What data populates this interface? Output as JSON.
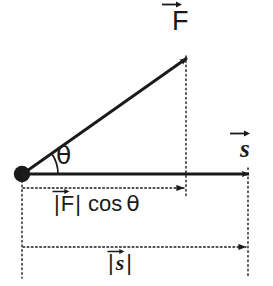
{
  "diagram": {
    "background_color": "#ffffff",
    "stroke_color": "#1a1a1a",
    "labels": {
      "force_vector": "F",
      "force_vector_accent": "vector-arrow",
      "displacement_vector": "s",
      "displacement_vector_accent": "vector-arrow",
      "angle": "θ",
      "force_component_bar_open": "|",
      "force_component_symbol": "F",
      "force_component_bar_close": "|",
      "force_component_cos": "cos",
      "force_component_angle": "θ",
      "displacement_magnitude_bar_open": "|",
      "displacement_magnitude_symbol": "s",
      "displacement_magnitude_bar_close": "|"
    },
    "geometry": {
      "origin_x": 22,
      "origin_y": 174,
      "force_tip_x": 186,
      "force_tip_y": 58,
      "displacement_tip_x": 248,
      "displacement_tip_y": 174,
      "fcos_dimension_y": 188,
      "smag_dimension_y": 247,
      "angle_arc_radius": 36,
      "angle_degrees": 35
    }
  }
}
